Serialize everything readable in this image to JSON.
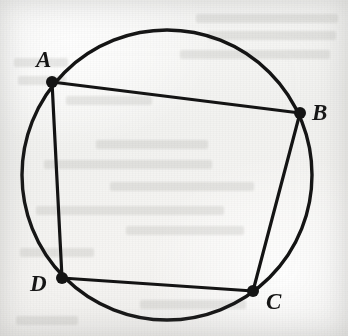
{
  "figure": {
    "canvas": {
      "width": 348,
      "height": 336
    },
    "background": {
      "kind": "scanned-paper",
      "paper_color": "#f3f3f1",
      "ink_color": "#141414",
      "showthrough_color": "#80807c"
    },
    "circle": {
      "name": "circumcircle",
      "center_x": 167,
      "center_y": 175,
      "radius": 145,
      "stroke_width": 3.4,
      "stroke": "#141414",
      "fill": "none"
    },
    "stroke_width_chord": 3.2,
    "vertex_dot_radius": 6,
    "vertices": [
      {
        "id": "A",
        "label": "A",
        "x": 52,
        "y": 82,
        "label_x": 36,
        "label_y": 48
      },
      {
        "id": "B",
        "label": "B",
        "x": 300,
        "y": 113,
        "label_x": 312,
        "label_y": 101
      },
      {
        "id": "C",
        "label": "C",
        "x": 253,
        "y": 291,
        "label_x": 266,
        "label_y": 290
      },
      {
        "id": "D",
        "label": "D",
        "x": 62,
        "y": 278,
        "label_x": 30,
        "label_y": 272
      }
    ],
    "edges": [
      {
        "id": "AB",
        "from": "A",
        "to": "B",
        "label": "side AB"
      },
      {
        "id": "BC",
        "from": "B",
        "to": "C",
        "label": "side BC"
      },
      {
        "id": "CD",
        "from": "C",
        "to": "D",
        "label": "side CD"
      },
      {
        "id": "DA",
        "from": "D",
        "to": "A",
        "label": "side DA"
      }
    ],
    "showthrough_lines": [
      {
        "x": 196,
        "y": 14,
        "w": 142
      },
      {
        "x": 208,
        "y": 31,
        "w": 128
      },
      {
        "x": 180,
        "y": 50,
        "w": 150
      },
      {
        "x": 14,
        "y": 58,
        "w": 54
      },
      {
        "x": 18,
        "y": 76,
        "w": 48
      },
      {
        "x": 66,
        "y": 96,
        "w": 86
      },
      {
        "x": 96,
        "y": 140,
        "w": 112
      },
      {
        "x": 44,
        "y": 160,
        "w": 168
      },
      {
        "x": 110,
        "y": 182,
        "w": 144
      },
      {
        "x": 36,
        "y": 206,
        "w": 188
      },
      {
        "x": 126,
        "y": 226,
        "w": 118
      },
      {
        "x": 20,
        "y": 248,
        "w": 74
      },
      {
        "x": 140,
        "y": 300,
        "w": 106
      },
      {
        "x": 16,
        "y": 316,
        "w": 62
      }
    ]
  }
}
